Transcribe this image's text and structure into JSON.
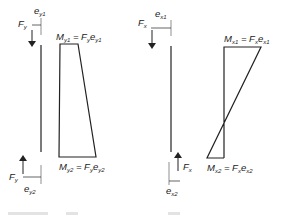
{
  "colors": {
    "line": "#222222",
    "background": "#ffffff"
  },
  "left_diagram": {
    "name": "bending about y-axis",
    "force_top": {
      "symbol": "F",
      "sub": "y",
      "direction": "down"
    },
    "ecc_top": {
      "symbol": "e",
      "sub": "y1"
    },
    "force_bottom": {
      "symbol": "F",
      "sub": "y",
      "direction": "up"
    },
    "ecc_bottom": {
      "symbol": "e",
      "sub": "y2"
    },
    "moment_top": {
      "lhs": "M",
      "lhs_sub": "y1",
      "eq": " = ",
      "rhs_f": "F",
      "rhs_f_sub": "y",
      "rhs_e": "e",
      "rhs_e_sub": "y1"
    },
    "moment_bottom": {
      "lhs": "M",
      "lhs_sub": "y2",
      "eq": " = ",
      "rhs_f": "F",
      "rhs_f_sub": "y",
      "rhs_e": "e",
      "rhs_e_sub": "y2"
    },
    "moment_shape": "trapezoid (single curvature)"
  },
  "right_diagram": {
    "name": "bending about x-axis",
    "force_top": {
      "symbol": "F",
      "sub": "x",
      "direction": "down"
    },
    "ecc_top": {
      "symbol": "e",
      "sub": "x1"
    },
    "force_bottom": {
      "symbol": "F",
      "sub": "x",
      "direction": "up"
    },
    "ecc_bottom": {
      "symbol": "e",
      "sub": "x2"
    },
    "moment_top": {
      "lhs": "M",
      "lhs_sub": "x1",
      "eq": " = ",
      "rhs_f": "F",
      "rhs_f_sub": "x",
      "rhs_e": "e",
      "rhs_e_sub": "x1"
    },
    "moment_bottom": {
      "lhs": "M",
      "lhs_sub": "x2",
      "eq": " = ",
      "rhs_f": "F",
      "rhs_f_sub": "x",
      "rhs_e": "e",
      "rhs_e_sub": "x2"
    },
    "moment_shape": "double curvature (crossing zero)"
  }
}
